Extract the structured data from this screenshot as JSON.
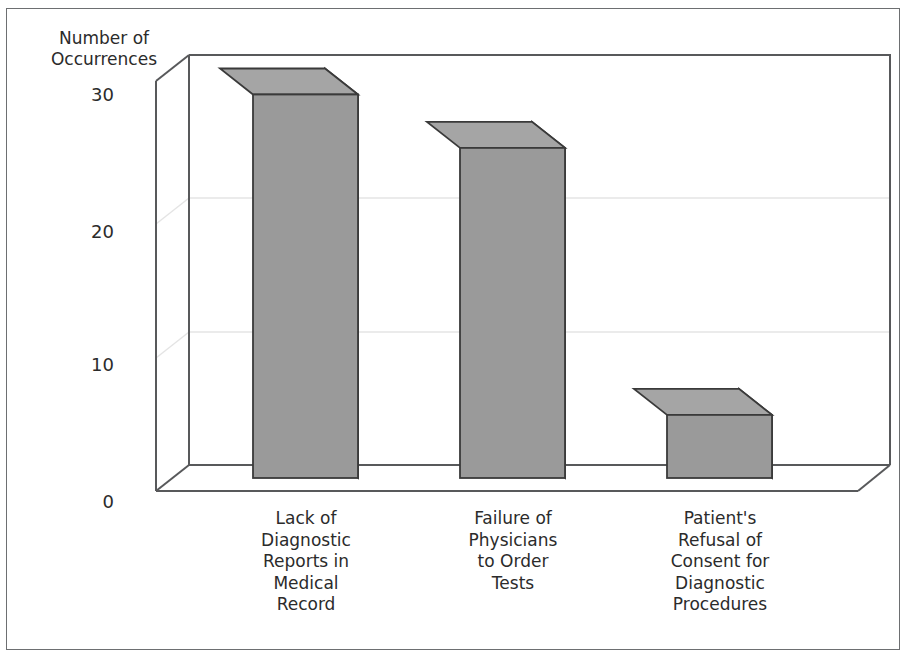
{
  "chart_data": {
    "type": "bar",
    "title": "",
    "subtitle": "",
    "xlabel": "",
    "ylabel": "Number of\nOccurrences",
    "categories": [
      "Lack of\nDiagnostic\nReports in\nMedical\nRecord",
      "Failure of\nPhysicians\nto Order\nTests",
      "Patient's\nRefusal of\nConsent for\nDiagnostic\nProcedures"
    ],
    "values": [
      30,
      26,
      6
    ],
    "ylim": [
      0,
      32
    ],
    "yticks": [
      "0",
      "10",
      "20",
      "30"
    ],
    "ytick_values": [
      0,
      10,
      20,
      30
    ],
    "grid": "horizontal-faint",
    "legend": "none",
    "style": "3d-bar",
    "bar_color": "#9a9a9a",
    "bar_top_color": "#a5a5a5",
    "bar_side_color": "#8e8e8e",
    "bar_edge_color": "#3a3a3a",
    "axis_color": "#58595b",
    "gridline_color": "#e4e4e4",
    "frame_color": "#6d6f71",
    "background": "#ffffff"
  },
  "geometry": {
    "front_baseline_y": 495,
    "y_per_unit": 13.35,
    "depth_dx": -33,
    "depth_dy": 26
  }
}
